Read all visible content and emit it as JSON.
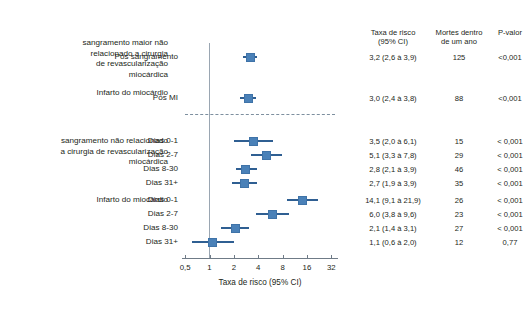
{
  "chart_data": {
    "type": "scatter",
    "title": "",
    "xlabel": "Taxa de risco (95% CI)",
    "ylabel": "",
    "xscale": "log",
    "xlim": [
      0.5,
      32
    ],
    "xticks": [
      "0,5",
      "1",
      "2",
      "4",
      "8",
      "16",
      "32"
    ],
    "xtick_values": [
      0.5,
      1,
      2,
      4,
      8,
      16,
      32
    ],
    "reference_line": 1,
    "grid": false,
    "legend": null,
    "columns": [
      "Taxa de risco (95% CI)",
      "Mortes dentro de um ano",
      "P-valor"
    ],
    "groups": [
      {
        "name": "sangramento maior não relacionado a cirurgia de revascularização miocárdica",
        "rows": [
          {
            "label": "Pós sangramento",
            "hr": 3.2,
            "ci_low": 2.6,
            "ci_high": 3.9,
            "hr_text": "3,2 (2,6 à 3,9)",
            "deaths": "125",
            "pvalue": "<0,001"
          }
        ]
      },
      {
        "name": "Infarto do miocárdio",
        "rows": [
          {
            "label": "Pós MI",
            "hr": 3.0,
            "ci_low": 2.4,
            "ci_high": 3.8,
            "hr_text": "3,0 (2,4 à 3,8)",
            "deaths": "88",
            "pvalue": "<0,001"
          }
        ]
      },
      {
        "name": "sangramento não relacionado a cirurgia de revascularização miocárdica",
        "rows": [
          {
            "label": "Dias 0-1",
            "hr": 3.5,
            "ci_low": 2.0,
            "ci_high": 6.1,
            "hr_text": "3,5 (2,0 à 6,1)",
            "deaths": "15",
            "pvalue": "< 0,001"
          },
          {
            "label": "Dias 2-7",
            "hr": 5.1,
            "ci_low": 3.3,
            "ci_high": 7.8,
            "hr_text": "5,1 (3,3 à 7,8)",
            "deaths": "29",
            "pvalue": "< 0,001"
          },
          {
            "label": "Dias 8-30",
            "hr": 2.8,
            "ci_low": 2.1,
            "ci_high": 3.9,
            "hr_text": "2,8 (2,1 à 3,9)",
            "deaths": "46",
            "pvalue": "< 0,001"
          },
          {
            "label": "Dias 31+",
            "hr": 2.7,
            "ci_low": 1.9,
            "ci_high": 3.9,
            "hr_text": "2,7 (1,9 à 3,9)",
            "deaths": "35",
            "pvalue": "< 0,001"
          }
        ]
      },
      {
        "name": "Infarto do miocárdio",
        "rows": [
          {
            "label": "Dias 0-1",
            "hr": 14.1,
            "ci_low": 9.1,
            "ci_high": 21.9,
            "hr_text": "14,1 (9,1 à 21,9)",
            "deaths": "26",
            "pvalue": "< 0,001"
          },
          {
            "label": "Dias 2-7",
            "hr": 6.0,
            "ci_low": 3.8,
            "ci_high": 9.6,
            "hr_text": "6,0 (3,8 à 9,6)",
            "deaths": "23",
            "pvalue": "< 0,001"
          },
          {
            "label": "Dias 8-30",
            "hr": 2.1,
            "ci_low": 1.4,
            "ci_high": 3.1,
            "hr_text": "2,1 (1,4 à 3,1)",
            "deaths": "27",
            "pvalue": "< 0,001"
          },
          {
            "label": "Dias 31+",
            "hr": 1.1,
            "ci_low": 0.6,
            "ci_high": 2.0,
            "hr_text": "1,1 (0,6 à 2,0)",
            "deaths": "12",
            "pvalue": "0,77"
          }
        ]
      }
    ]
  },
  "headers": {
    "hr": "Taxa de risco\n(95% CI)",
    "deaths": "Mortes dentro\nde um ano",
    "pvalue": "P-valor"
  },
  "group_labels": {
    "g0": "sangramento maior não\nrelacionado a cirurgia\nde revascularização\nmiocárdica",
    "g1": "Infarto do miocárdio",
    "g2": "sangramento não relacionado\na cirurgia de revascularização\nmiocárdica",
    "g3": "Infarto do miocárdio"
  },
  "axis": {
    "title": "Taxa de risco (95% CI)",
    "ticks": [
      "0,5",
      "1",
      "2",
      "4",
      "8",
      "16",
      "32"
    ]
  },
  "colors": {
    "marker": "#4a81b8",
    "marker_edge": "#3f73a8",
    "whisker": "#2f5f92",
    "axis": "#6f7b87",
    "reference_line": "#9aa6b2",
    "dashed_separator": "#7d8f9f",
    "text": "#231f20"
  }
}
